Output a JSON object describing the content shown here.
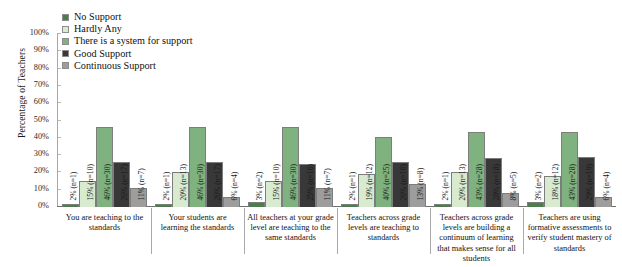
{
  "chart_data": {
    "type": "bar",
    "title": "",
    "xlabel": "",
    "ylabel": "Percentage of Teachers",
    "ylim": [
      0,
      100
    ],
    "ytick_labels": [
      "100%",
      "90%",
      "80%",
      "70%",
      "60%",
      "50%",
      "40%",
      "30%",
      "20%",
      "10%",
      "0%"
    ],
    "ytick_values": [
      100,
      90,
      80,
      70,
      60,
      50,
      40,
      30,
      20,
      10,
      0
    ],
    "grid": false,
    "legend_position": "top-left",
    "categories": [
      "You are teaching to the standards",
      "Your students are learning the standards",
      "All teachers at your grade level are teaching to the same standards",
      "Teachers across grade levels are teaching to standards",
      "Teachers across grade levels are building a continuum of learning that makes sense for all students",
      "Teachers are using formative assessments to verify student mastery of standards"
    ],
    "series": [
      {
        "name": "No Support",
        "color": "#4d7c4d",
        "values": [
          2,
          2,
          3,
          2,
          2,
          3
        ],
        "counts": [
          1,
          1,
          2,
          1,
          1,
          2
        ],
        "labels": [
          "2% (n=1)",
          "2% (n=1)",
          "3% (n=2)",
          "2% (n=1)",
          "2% (n=1)",
          "3% (n=2)"
        ]
      },
      {
        "name": "Hardly Any",
        "color": "#d8eacf",
        "values": [
          15,
          20,
          15,
          19,
          20,
          18
        ],
        "counts": [
          10,
          13,
          10,
          12,
          13,
          12
        ],
        "labels": [
          "15% (n=10)",
          "20% (n=13)",
          "15% (n=10)",
          "19% (n=12)",
          "20% (n=13)",
          "18% (n=12)"
        ]
      },
      {
        "name": "There is a system for support",
        "color": "#7fb27f",
        "values": [
          46,
          46,
          46,
          40,
          43,
          43
        ],
        "counts": [
          30,
          30,
          30,
          25,
          28,
          28
        ],
        "labels": [
          "46% (n=30)",
          "46% (n=30)",
          "46% (n=30)",
          "40% (n=25)",
          "43% (n=28)",
          "43% (n=28)"
        ]
      },
      {
        "name": "Good Support",
        "color": "#383838",
        "values": [
          26,
          26,
          25,
          26,
          28,
          29
        ],
        "counts": [
          17,
          17,
          16,
          16,
          18,
          19
        ],
        "labels": [
          "26% (n=17)",
          "26% (n=17)",
          "25% (n=16)",
          "26% (n=16)",
          "28% (n=18)",
          "29% (n=19)"
        ]
      },
      {
        "name": "Continuous Support",
        "color": "#9d9d9d",
        "values": [
          11,
          6,
          11,
          13,
          8,
          6
        ],
        "counts": [
          7,
          4,
          7,
          8,
          5,
          4
        ],
        "labels": [
          "11% (n=7)",
          "6% (n=4)",
          "11% (n=7)",
          "13% (n=8)",
          "8% (n=5)",
          "6% (n=4)"
        ]
      }
    ]
  },
  "legend": {
    "items": [
      {
        "label": "No Support",
        "color": "#4d7c4d"
      },
      {
        "label": "Hardly Any",
        "color": "#d8eacf"
      },
      {
        "label": "There is a system for support",
        "color": "#7fb27f"
      },
      {
        "label": "Good Support",
        "color": "#383838"
      },
      {
        "label": "Continuous Support",
        "color": "#9d9d9d"
      }
    ]
  }
}
